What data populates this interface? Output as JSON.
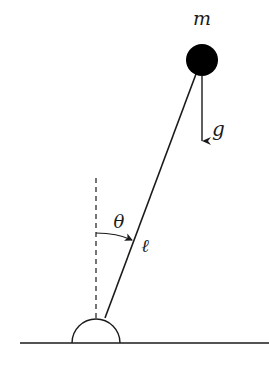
{
  "diagram": {
    "labels": {
      "mass": "m",
      "gravity": "g",
      "angle": "θ",
      "length": "ℓ"
    },
    "colors": {
      "line": "#1a1a1a",
      "bob": "#000000",
      "background": "#ffffff"
    }
  }
}
